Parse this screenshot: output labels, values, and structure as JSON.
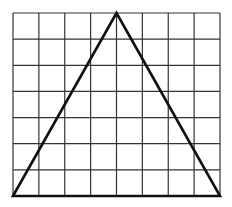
{
  "diagram": {
    "type": "grid-with-triangle",
    "grid": {
      "columns": 8,
      "rows": 7,
      "left": 13,
      "top": 13,
      "right": 220,
      "bottom": 196,
      "line_color": "#333333",
      "line_width": 1.2
    },
    "triangle": {
      "vertices_grid_units": [
        [
          0,
          7
        ],
        [
          4,
          0
        ],
        [
          8,
          7
        ]
      ],
      "stroke_color": "#111111",
      "stroke_width": 2.6
    }
  }
}
